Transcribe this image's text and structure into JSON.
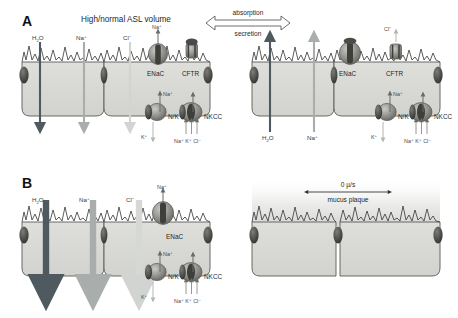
{
  "figure": {
    "title_a": "High/normal ASL volume",
    "title_b": "Low ASL volume",
    "panel_a_letter": "A",
    "panel_b_letter": "B",
    "direction_top": "absorption",
    "direction_bottom": "secretion",
    "mucus_rate": "0 µ/s",
    "mucus_label": "mucus plaque"
  },
  "ions": {
    "water": "H",
    "water_sub": "2",
    "water_tail": "O",
    "sodium": "Na",
    "sodium_sup": "+",
    "chloride": "Cl",
    "chloride_sup": "−",
    "potassium": "K",
    "potassium_sup": "+",
    "nkcc_ions": "Na⁺ K⁺ Cl⁻"
  },
  "channels": {
    "enac": "ENaC",
    "cftr": "CFTR",
    "nak": "N/K",
    "nkcc": "NKCC"
  },
  "colors": {
    "water_arrow": "#4f5a60",
    "sodium_arrow": "#a9adac",
    "chloride_arrow": "#d6d8d6",
    "cell_fill": "#d9dad6",
    "cell_stroke": "#5a5a56",
    "junction": "#4a4a48",
    "protein_dark": "#6e6f6a",
    "protein_light": "#bcbdb8",
    "mucus": "#e4e4e2"
  },
  "panel_a_left": {
    "arrows": [
      {
        "ion": "H2O",
        "direction": "down",
        "tone": "dark"
      },
      {
        "ion": "Na+",
        "direction": "down",
        "tone": "mid"
      },
      {
        "ion": "Cl-",
        "direction": "down",
        "tone": "light"
      }
    ],
    "apical_channels": [
      "ENaC",
      "CFTR"
    ],
    "basolateral_channels": [
      "N/K",
      "NKCC"
    ]
  },
  "panel_a_right": {
    "arrows": [
      {
        "ion": "H2O",
        "direction": "up",
        "tone": "dark"
      },
      {
        "ion": "Na+",
        "direction": "up",
        "tone": "mid"
      },
      {
        "ion": "Cl-",
        "direction": "up",
        "tone": "light"
      }
    ],
    "apical_channels": [
      "ENaC",
      "CFTR"
    ],
    "basolateral_channels": [
      "N/K",
      "NKCC"
    ]
  },
  "panel_b_left": {
    "arrows": [
      {
        "ion": "H2O",
        "direction": "down",
        "tone": "dark"
      },
      {
        "ion": "Na+",
        "direction": "down",
        "tone": "mid"
      },
      {
        "ion": "Cl-",
        "direction": "down",
        "tone": "light"
      }
    ],
    "apical_channels": [
      "ENaC"
    ],
    "basolateral_channels": [
      "N/K",
      "NKCC"
    ]
  },
  "panel_b_right": {
    "arrows": [],
    "apical_channels": [],
    "basolateral_channels": []
  }
}
